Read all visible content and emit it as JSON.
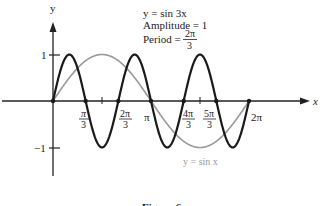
{
  "chart_data": {
    "type": "line",
    "title": "",
    "xlabel": "x",
    "ylabel": "y",
    "xlim": [
      0,
      6.9
    ],
    "ylim": [
      -1.3,
      1.5
    ],
    "grid": false,
    "annotation": {
      "line1": "y = sin 3x",
      "line2": "Amplitude = 1",
      "line3_prefix": "Period = ",
      "line3_num": "2π",
      "line3_den": "3"
    },
    "x_ticks": [
      {
        "num": "π",
        "den": "3",
        "value": 1.0472
      },
      {
        "num": "2π",
        "den": "3",
        "value": 2.0944
      },
      {
        "label": "π",
        "value": 3.1416
      },
      {
        "num": "4π",
        "den": "3",
        "value": 4.1888
      },
      {
        "num": "5π",
        "den": "3",
        "value": 5.236
      },
      {
        "label": "2π",
        "value": 6.2832
      }
    ],
    "y_ticks": [
      {
        "label": "1",
        "value": 1
      },
      {
        "label": "−1",
        "value": -1
      }
    ],
    "series": [
      {
        "name": "y = sin 3x",
        "color": "#1a1a1a",
        "stroke_width": 2.2,
        "x_range": [
          0,
          6.2832
        ],
        "amplitude": 1,
        "frequency": 3,
        "zeros": [
          0,
          1.0472,
          2.0944,
          3.1416,
          4.1888,
          5.236,
          6.2832
        ]
      },
      {
        "name": "y = sin x",
        "color": "#999999",
        "stroke_width": 1.6,
        "x_range": [
          0,
          6.2832
        ],
        "amplitude": 1,
        "frequency": 1,
        "label": "y = sin x"
      }
    ],
    "caption": "Figure 6"
  }
}
